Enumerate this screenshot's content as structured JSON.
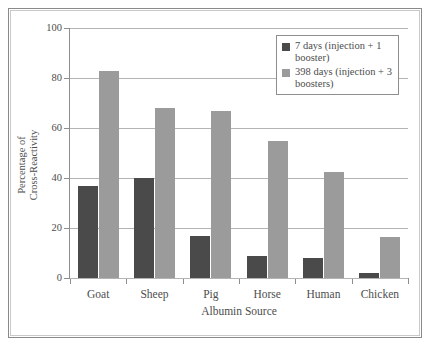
{
  "chart_data": {
    "type": "bar",
    "title": "",
    "subtitle": "",
    "xlabel": "Albumin Source",
    "ylabel": "Percentage of Cross-Reactivity",
    "ylabel_lines": [
      "Percentage of",
      "Cross-Reactivity"
    ],
    "ylim": [
      0,
      100
    ],
    "yticks": [
      0,
      20,
      40,
      60,
      80,
      100
    ],
    "ytick_labels": [
      "0",
      "20",
      "40",
      "60",
      "80",
      "100"
    ],
    "grid": "horizontal",
    "legend_position": "top-right",
    "categories": [
      "Goat",
      "Sheep",
      "Pig",
      "Horse",
      "Human",
      "Chicken"
    ],
    "series": [
      {
        "name": "7 days (injection + 1 booster)",
        "name_lines": [
          "7 days (injection +",
          "1 booster)"
        ],
        "color": "#4a4a4a",
        "values": [
          37,
          40,
          17,
          9,
          8,
          2
        ]
      },
      {
        "name": "398 days (injection + 3 boosters)",
        "name_lines": [
          "398 days (injection",
          "+ 3 boosters)"
        ],
        "color": "#9b9b9b",
        "values": [
          83,
          68,
          67,
          55,
          42.5,
          16.5
        ]
      }
    ]
  },
  "figure": {
    "border_color": "#8a8a8a",
    "background": "#ffffff",
    "axis_color": "#8e8e8e",
    "gridline_color": "#b4b4b4",
    "text_color": "#4d4d4d"
  }
}
